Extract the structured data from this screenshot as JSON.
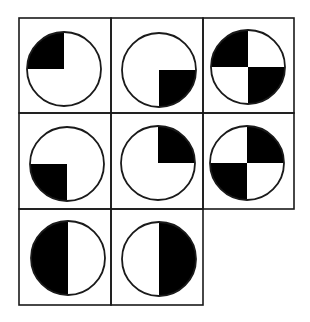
{
  "puzzle": {
    "type": "matrix-pattern-puzzle",
    "rows": 3,
    "cols": 3,
    "colors": {
      "background": "#ffffff",
      "line": "#1a1a1a",
      "fill_dark": "#000000",
      "fill_light": "#ffffff"
    },
    "grid": {
      "col_edges": [
        19,
        111,
        203,
        294
      ],
      "row_edges": [
        18,
        113,
        209,
        305
      ]
    },
    "cells": [
      {
        "row": 0,
        "col": 0,
        "cx": 64,
        "cy": 69,
        "r": 37,
        "filled": [
          "top-left"
        ]
      },
      {
        "row": 0,
        "col": 1,
        "cx": 159,
        "cy": 70,
        "r": 37,
        "filled": [
          "bottom-right"
        ]
      },
      {
        "row": 0,
        "col": 2,
        "cx": 248,
        "cy": 67,
        "r": 37,
        "filled": [
          "top-left",
          "bottom-right"
        ]
      },
      {
        "row": 1,
        "col": 0,
        "cx": 67,
        "cy": 164,
        "r": 37,
        "filled": [
          "bottom-left"
        ]
      },
      {
        "row": 1,
        "col": 1,
        "cx": 158,
        "cy": 163,
        "r": 37,
        "filled": [
          "top-right"
        ]
      },
      {
        "row": 1,
        "col": 2,
        "cx": 247,
        "cy": 163,
        "r": 37,
        "filled": [
          "top-right",
          "bottom-left"
        ]
      },
      {
        "row": 2,
        "col": 0,
        "cx": 68,
        "cy": 258,
        "r": 37,
        "filled": [
          "top-left",
          "bottom-left"
        ]
      },
      {
        "row": 2,
        "col": 1,
        "cx": 159,
        "cy": 259,
        "r": 37,
        "filled": [
          "top-right",
          "bottom-right"
        ]
      },
      {
        "row": 2,
        "col": 2,
        "empty": true
      }
    ]
  }
}
